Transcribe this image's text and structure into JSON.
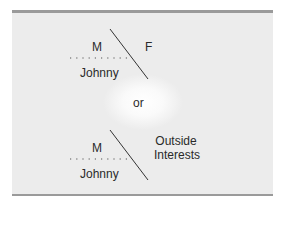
{
  "diagram": {
    "top": {
      "left_upper": "M",
      "right": "F",
      "left_lower": "Johnny"
    },
    "separator": "or",
    "bottom": {
      "left_upper": "M",
      "right_line1": "Outside",
      "right_line2": "Interests",
      "left_lower": "Johnny"
    }
  }
}
